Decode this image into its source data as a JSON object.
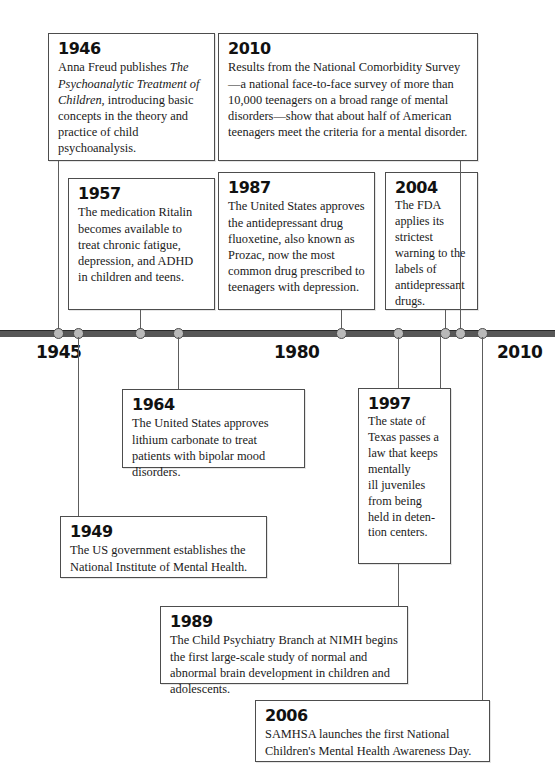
{
  "axis": {
    "label_1945": "1945",
    "label_1980": "1980",
    "label_2010": "2010",
    "line_color": "#575757",
    "dot_color": "#b9b9b9"
  },
  "events": {
    "e1946": {
      "year": "1946",
      "text": "Anna Freud publishes ",
      "italic": "The Psychoanalytic Treatment of Children",
      "text2": ", introducing basic concepts in the theory and practice of child psychoanalysis."
    },
    "e1957": {
      "year": "1957",
      "text": "The medication Ritalin becomes available to treat chronic fatigue, depression, and ADHD in children and teens."
    },
    "e1987": {
      "year": "1987",
      "text": "The United States approves the antidepressant drug fluoxetine, also known as Prozac, now the most common drug prescribed to teenagers with depression."
    },
    "e2010": {
      "year": "2010",
      "text": "Results from the National Comorbidity Survey—a national face-to-face survey of more than 10,000 teenagers on a broad range of mental disorders—show that about half of American teenagers meet the criteria for a mental disorder."
    },
    "e2004": {
      "year": "2004",
      "text": "The FDA applies its strictest warning to the labels of antidepressant drugs."
    },
    "e1964": {
      "year": "1964",
      "text": "The United States approves lithium carbonate to treat patients with bipolar mood disorders."
    },
    "e1997": {
      "year": "1997",
      "text": "The state of Texas passes a law that keeps mentally ill juveniles from being held in detention centers."
    },
    "e1949": {
      "year": "1949",
      "text": "The US government establishes the National Institute of Mental Health."
    },
    "e1989": {
      "year": "1989",
      "text": "The Child Psychiatry Branch at NIMH begins the first large-scale study of normal and abnormal brain development in children and adolescents."
    },
    "e2006": {
      "year": "2006",
      "text": "SAMHSA launches the first National Children's Mental Health Awareness Day."
    }
  }
}
